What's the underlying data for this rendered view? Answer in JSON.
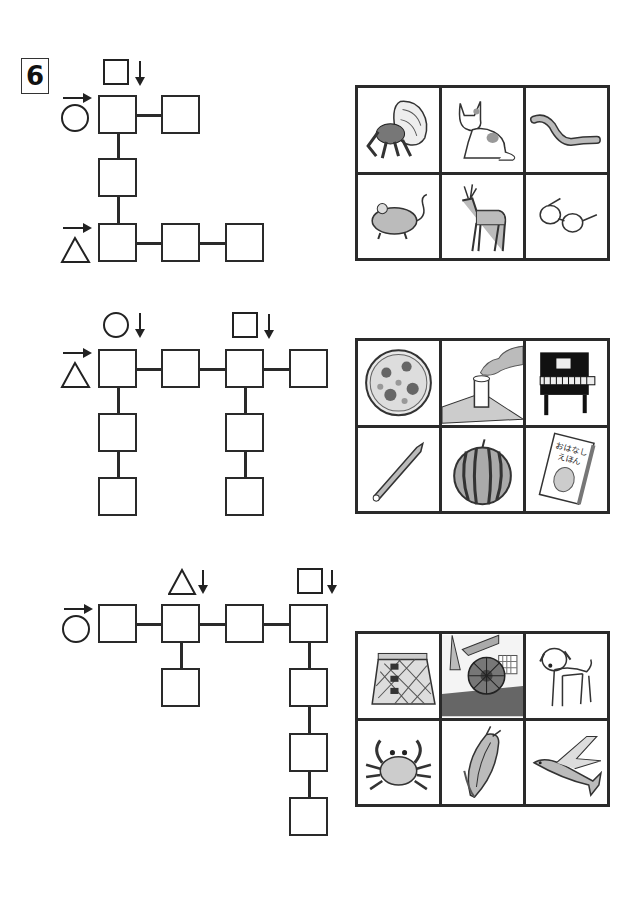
{
  "problem": {
    "number": "6"
  },
  "sections": [
    {
      "start_symbol": "circle",
      "second_start_symbol": "triangle",
      "down_markers": [
        "square"
      ],
      "pictures": [
        {
          "name": "hermit crab",
          "icon": "hermit-crab-icon"
        },
        {
          "name": "cat",
          "icon": "cat-icon"
        },
        {
          "name": "earthworm",
          "icon": "earthworm-icon"
        },
        {
          "name": "mouse",
          "icon": "mouse-icon"
        },
        {
          "name": "deer",
          "icon": "deer-icon"
        },
        {
          "name": "glasses",
          "icon": "glasses-icon"
        }
      ]
    },
    {
      "start_symbol": "triangle",
      "down_markers": [
        "circle",
        "square"
      ],
      "pictures": [
        {
          "name": "pizza",
          "icon": "pizza-icon"
        },
        {
          "name": "chimney",
          "icon": "chimney-icon"
        },
        {
          "name": "piano",
          "icon": "piano-icon"
        },
        {
          "name": "pencil",
          "icon": "pencil-icon"
        },
        {
          "name": "watermelon",
          "icon": "watermelon-icon"
        },
        {
          "name": "picture book",
          "icon": "book-icon",
          "text_line1": "おはなし",
          "text_line2": "えほん"
        }
      ]
    },
    {
      "start_symbol": "circle",
      "down_markers": [
        "triangle",
        "square"
      ],
      "pictures": [
        {
          "name": "skirt",
          "icon": "skirt-icon"
        },
        {
          "name": "water wheel",
          "icon": "water-wheel-icon"
        },
        {
          "name": "puppy",
          "icon": "dog-icon"
        },
        {
          "name": "crab",
          "icon": "crab-icon"
        },
        {
          "name": "corn",
          "icon": "corn-icon"
        },
        {
          "name": "flying fish",
          "icon": "flying-fish-icon"
        }
      ]
    }
  ]
}
